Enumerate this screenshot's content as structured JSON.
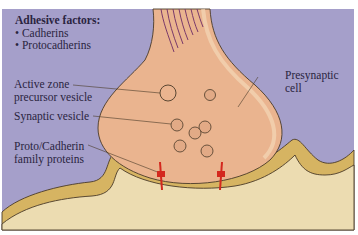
{
  "figure": {
    "type": "synapse-diagram",
    "colors": {
      "background": "#a59fca",
      "presynaptic_fill": "#eab48f",
      "postsynaptic_fill": "#ecdcb1",
      "membrane_band": "#d6b462",
      "outline": "#4a3a28",
      "cytoskeleton_lines": "#7a3a6a",
      "protein": "#d4281e",
      "label_text": "#2a2440"
    }
  },
  "legend": {
    "title": "Adhesive factors:",
    "items": [
      "Cadherins",
      "Protocadherins"
    ]
  },
  "labels": {
    "active_zone_line1": "Active zone",
    "active_zone_line2": "precursor vesicle",
    "synaptic_vesicle": "Synaptic vesicle",
    "proteins_line1": "Proto/Cadherin",
    "proteins_line2": "family proteins",
    "presynaptic_line1": "Presynaptic",
    "presynaptic_line2": "cell"
  }
}
